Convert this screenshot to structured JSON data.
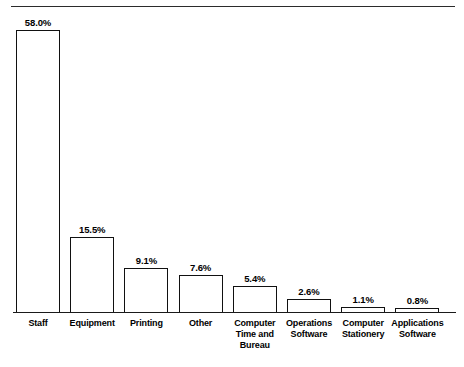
{
  "chart_data": {
    "type": "bar",
    "title": "",
    "subtitle": "",
    "xlabel": "",
    "ylabel": "",
    "ylim": [
      0,
      58
    ],
    "grid": false,
    "legend": "none",
    "orientation": "vertical",
    "value_label_format": "percent-one-decimal",
    "categories": [
      "Staff",
      "Equipment",
      "Printing",
      "Other",
      "Computer Time and Bureau",
      "Operations Software",
      "Computer Stationery",
      "Applications Software"
    ],
    "category_lines": [
      [
        "Staff"
      ],
      [
        "Equipment"
      ],
      [
        "Printing"
      ],
      [
        "Other"
      ],
      [
        "Computer",
        "Time and",
        "Bureau"
      ],
      [
        "Operations",
        "Software"
      ],
      [
        "Computer",
        "Stationery"
      ],
      [
        "Applications",
        "Software"
      ]
    ],
    "values": [
      58.0,
      15.5,
      9.1,
      7.6,
      5.4,
      2.6,
      1.1,
      0.8
    ],
    "value_labels": [
      "58.0%",
      "15.5%",
      "9.1%",
      "7.6%",
      "5.4%",
      "2.6%",
      "1.1%",
      "0.8%"
    ],
    "colors": {
      "bar_fill": "#ffffff",
      "bar_stroke": "#111111",
      "axis": "#1a1a1a",
      "rule": "#2b2b2b",
      "text": "#000000",
      "background": "#ffffff"
    }
  }
}
